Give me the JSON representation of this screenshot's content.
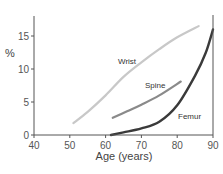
{
  "chart_data": {
    "type": "line",
    "title": "",
    "xlabel": "Age (years)",
    "ylabel": "%",
    "xlim": [
      40,
      90
    ],
    "ylim": [
      0,
      18
    ],
    "xticks": [
      40,
      50,
      60,
      70,
      80,
      90
    ],
    "yticks": [
      0,
      5,
      10,
      15
    ],
    "grid": false,
    "legend": "inline labels",
    "series": [
      {
        "name": "Wrist",
        "color": "#c8c8c8",
        "x": [
          51,
          55,
          60,
          65,
          70,
          75,
          80,
          86
        ],
        "values": [
          1.8,
          3.5,
          6.0,
          8.8,
          11.0,
          13.0,
          14.8,
          16.5
        ]
      },
      {
        "name": "Spine",
        "color": "#8a8a8a",
        "x": [
          62,
          66,
          70,
          75,
          81
        ],
        "values": [
          2.6,
          3.6,
          4.6,
          6.0,
          8.1
        ]
      },
      {
        "name": "Femur",
        "color": "#3a3a3a",
        "x": [
          61.5,
          65,
          70,
          75,
          80,
          85,
          88,
          90
        ],
        "values": [
          0,
          0.4,
          1.0,
          2.0,
          4.5,
          9.0,
          12.5,
          16.0
        ]
      }
    ]
  }
}
